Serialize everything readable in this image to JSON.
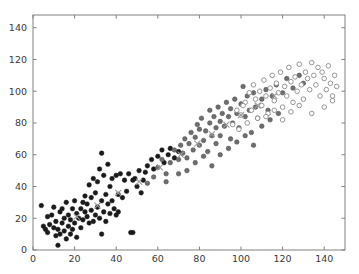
{
  "figure": {
    "background_color": "#ffffff",
    "width": 359,
    "height": 274
  },
  "axes": {
    "frame_color": "#808080",
    "frame_left_px": 33,
    "frame_right_px": 345,
    "frame_top_px": 15,
    "frame_bottom_px": 250,
    "tick_color": "#808080",
    "tick_label_color": "#3a3a3a"
  },
  "chart_data": {
    "type": "scatter",
    "title": "",
    "subtitle": "",
    "xlabel": "",
    "ylabel": "",
    "xlim": [
      0,
      150
    ],
    "ylim": [
      0,
      148
    ],
    "xticks": [
      0,
      20,
      40,
      60,
      80,
      100,
      120,
      140
    ],
    "yticks": [
      0,
      20,
      40,
      60,
      80,
      100,
      120,
      140
    ],
    "xtick_labels": [
      "0",
      "20",
      "40",
      "60",
      "80",
      "100",
      "120",
      "140"
    ],
    "ytick_labels": [
      "0",
      "20",
      "40",
      "60",
      "80",
      "100",
      "120",
      "140"
    ],
    "grid": false,
    "legend": null,
    "legend_position": "none",
    "annotations": [],
    "series": [
      {
        "name": "dark-filled-circles",
        "marker": "circle-filled",
        "color": "#1a1a1a",
        "edge_color": "#1a1a1a",
        "size": 4.6,
        "points": [
          [
            4,
            28
          ],
          [
            5,
            15
          ],
          [
            6,
            13
          ],
          [
            7,
            21
          ],
          [
            7,
            11
          ],
          [
            8,
            16
          ],
          [
            9,
            22
          ],
          [
            10,
            14
          ],
          [
            10,
            27
          ],
          [
            11,
            9
          ],
          [
            11,
            18
          ],
          [
            12,
            13
          ],
          [
            12,
            3
          ],
          [
            13,
            24
          ],
          [
            13,
            10
          ],
          [
            14,
            17
          ],
          [
            14,
            26
          ],
          [
            15,
            12
          ],
          [
            15,
            20
          ],
          [
            16,
            7
          ],
          [
            16,
            30
          ],
          [
            17,
            15
          ],
          [
            17,
            22
          ],
          [
            18,
            10
          ],
          [
            18,
            19
          ],
          [
            19,
            26
          ],
          [
            19,
            13
          ],
          [
            20,
            31
          ],
          [
            20,
            17
          ],
          [
            21,
            23
          ],
          [
            21,
            8
          ],
          [
            22,
            20
          ],
          [
            23,
            26
          ],
          [
            23,
            14
          ],
          [
            24,
            30
          ],
          [
            24,
            19
          ],
          [
            25,
            24
          ],
          [
            25,
            34
          ],
          [
            26,
            29
          ],
          [
            26,
            21
          ],
          [
            27,
            41
          ],
          [
            27,
            17
          ],
          [
            28,
            25
          ],
          [
            28,
            33
          ],
          [
            29,
            18
          ],
          [
            29,
            45
          ],
          [
            30,
            22
          ],
          [
            30,
            36
          ],
          [
            31,
            43
          ],
          [
            31,
            27
          ],
          [
            32,
            20
          ],
          [
            32,
            51
          ],
          [
            33,
            31
          ],
          [
            33,
            61
          ],
          [
            33,
            10
          ],
          [
            34,
            24
          ],
          [
            34,
            47
          ],
          [
            35,
            35
          ],
          [
            35,
            18
          ],
          [
            36,
            29
          ],
          [
            36,
            54
          ],
          [
            37,
            23
          ],
          [
            37,
            40
          ],
          [
            38,
            45
          ],
          [
            38,
            31
          ],
          [
            39,
            26
          ],
          [
            40,
            47
          ],
          [
            40,
            22
          ],
          [
            41,
            35
          ],
          [
            41,
            24
          ],
          [
            42,
            48
          ],
          [
            43,
            33
          ],
          [
            44,
            44
          ],
          [
            45,
            37
          ],
          [
            46,
            48
          ],
          [
            47,
            11
          ],
          [
            48,
            11
          ],
          [
            48,
            44
          ],
          [
            49,
            45
          ],
          [
            50,
            40
          ],
          [
            51,
            50
          ],
          [
            52,
            36
          ],
          [
            53,
            44
          ],
          [
            54,
            49
          ],
          [
            55,
            53
          ],
          [
            57,
            57
          ],
          [
            58,
            51
          ],
          [
            60,
            59
          ],
          [
            62,
            63
          ],
          [
            63,
            55
          ],
          [
            65,
            60
          ],
          [
            66,
            64
          ],
          [
            68,
            58
          ],
          [
            70,
            62
          ]
        ]
      },
      {
        "name": "gray-filled-circles",
        "marker": "circle-filled",
        "color": "#6e6e6e",
        "edge_color": "#4a4a4a",
        "size": 4.6,
        "points": [
          [
            55,
            42
          ],
          [
            58,
            46
          ],
          [
            60,
            52
          ],
          [
            62,
            57
          ],
          [
            64,
            48
          ],
          [
            66,
            55
          ],
          [
            68,
            63
          ],
          [
            70,
            57
          ],
          [
            71,
            66
          ],
          [
            72,
            61
          ],
          [
            73,
            70
          ],
          [
            74,
            58
          ],
          [
            75,
            67
          ],
          [
            76,
            74
          ],
          [
            77,
            63
          ],
          [
            78,
            71
          ],
          [
            79,
            79
          ],
          [
            80,
            66
          ],
          [
            80,
            76
          ],
          [
            81,
            83
          ],
          [
            82,
            69
          ],
          [
            83,
            75
          ],
          [
            84,
            62
          ],
          [
            85,
            80
          ],
          [
            85,
            88
          ],
          [
            86,
            72
          ],
          [
            87,
            84
          ],
          [
            88,
            77
          ],
          [
            88,
            67
          ],
          [
            89,
            90
          ],
          [
            90,
            81
          ],
          [
            90,
            72
          ],
          [
            91,
            86
          ],
          [
            92,
            78
          ],
          [
            93,
            93
          ],
          [
            94,
            84
          ],
          [
            95,
            70
          ],
          [
            95,
            89
          ],
          [
            96,
            80
          ],
          [
            97,
            95
          ],
          [
            98,
            86
          ],
          [
            99,
            77
          ],
          [
            100,
            92
          ],
          [
            101,
            103
          ],
          [
            102,
            84
          ],
          [
            103,
            97
          ],
          [
            104,
            88
          ],
          [
            105,
            74
          ],
          [
            106,
            99
          ],
          [
            107,
            90
          ],
          [
            108,
            83
          ],
          [
            110,
            95
          ],
          [
            112,
            101
          ],
          [
            113,
            88
          ],
          [
            115,
            97
          ],
          [
            117,
            104
          ],
          [
            120,
            99
          ],
          [
            122,
            108
          ],
          [
            125,
            102
          ],
          [
            128,
            110
          ],
          [
            130,
            105
          ],
          [
            64,
            43
          ],
          [
            70,
            48
          ],
          [
            74,
            50
          ],
          [
            78,
            55
          ],
          [
            82,
            59
          ],
          [
            86,
            53
          ],
          [
            90,
            60
          ],
          [
            94,
            64
          ],
          [
            98,
            68
          ],
          [
            102,
            72
          ],
          [
            106,
            66
          ],
          [
            110,
            78
          ],
          [
            114,
            82
          ],
          [
            118,
            86
          ]
        ]
      },
      {
        "name": "open-circles",
        "marker": "circle-open",
        "color": "#ffffff",
        "edge_color": "#8a8a8a",
        "size": 4.6,
        "points": [
          [
            100,
            85
          ],
          [
            102,
            93
          ],
          [
            104,
            99
          ],
          [
            105,
            88
          ],
          [
            106,
            104
          ],
          [
            107,
            95
          ],
          [
            108,
            83
          ],
          [
            109,
            100
          ],
          [
            110,
            91
          ],
          [
            111,
            107
          ],
          [
            112,
            97
          ],
          [
            113,
            86
          ],
          [
            114,
            102
          ],
          [
            115,
            110
          ],
          [
            116,
            94
          ],
          [
            117,
            105
          ],
          [
            118,
            99
          ],
          [
            119,
            112
          ],
          [
            120,
            90
          ],
          [
            121,
            103
          ],
          [
            122,
            97
          ],
          [
            123,
            115
          ],
          [
            124,
            106
          ],
          [
            125,
            93
          ],
          [
            126,
            109
          ],
          [
            127,
            100
          ],
          [
            128,
            117
          ],
          [
            129,
            104
          ],
          [
            130,
            95
          ],
          [
            131,
            112
          ],
          [
            132,
            108
          ],
          [
            133,
            101
          ],
          [
            134,
            118
          ],
          [
            135,
            110
          ],
          [
            136,
            104
          ],
          [
            137,
            115
          ],
          [
            138,
            97
          ],
          [
            139,
            112
          ],
          [
            140,
            108
          ],
          [
            141,
            101
          ],
          [
            142,
            116
          ],
          [
            143,
            105
          ],
          [
            144,
            97
          ],
          [
            145,
            110
          ],
          [
            146,
            103
          ],
          [
            96,
            79
          ],
          [
            98,
            88
          ],
          [
            99,
            76
          ],
          [
            101,
            91
          ],
          [
            103,
            80
          ],
          [
            112,
            84
          ],
          [
            116,
            88
          ],
          [
            120,
            82
          ],
          [
            124,
            87
          ],
          [
            128,
            91
          ],
          [
            134,
            86
          ],
          [
            140,
            90
          ],
          [
            144,
            94
          ]
        ]
      },
      {
        "name": "gray-x-markers",
        "marker": "x",
        "color": "#9a9a9a",
        "edge_color": "#9a9a9a",
        "size": 6.0,
        "points": [
          [
            21,
            21
          ],
          [
            31,
            28
          ],
          [
            41,
            36
          ],
          [
            51,
            43
          ],
          [
            61,
            52
          ],
          [
            71,
            60
          ],
          [
            79,
            67
          ],
          [
            86,
            73
          ],
          [
            93,
            79
          ],
          [
            100,
            85
          ],
          [
            108,
            91
          ],
          [
            116,
            97
          ]
        ]
      }
    ]
  }
}
